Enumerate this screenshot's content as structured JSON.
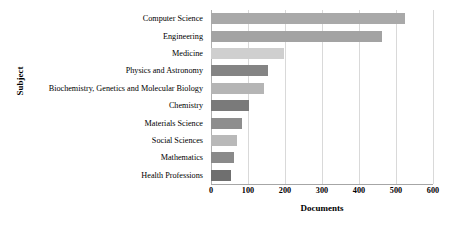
{
  "chart_data": {
    "type": "bar",
    "orientation": "horizontal",
    "title": "",
    "xlabel": "Documents",
    "ylabel": "Subject",
    "xlim": [
      0,
      600
    ],
    "xticks": [
      0,
      100,
      200,
      300,
      400,
      500,
      600
    ],
    "xtick_labels": [
      "0",
      "100",
      "200",
      "300",
      "400",
      "500",
      "600"
    ],
    "grid": true,
    "grid_axis": "x",
    "legend": null,
    "categories": [
      "Computer Science",
      "Engineering",
      "Medicine",
      "Physics and Astronomy",
      "Biochemistry, Genetics and Molecular Biology",
      "Chemistry",
      "Materials Science",
      "Social Sciences",
      "Mathematics",
      "Health Professions"
    ],
    "values": [
      524,
      462,
      196,
      155,
      143,
      102,
      84,
      70,
      62,
      55
    ],
    "bar_colors": [
      "#a9a9a9",
      "#a3a3a3",
      "#cfcfcf",
      "#848484",
      "#b5b5b5",
      "#7a7a7a",
      "#8e8e8e",
      "#b9b9b9",
      "#8a8a8a",
      "#6f6f6f"
    ]
  },
  "colors": {
    "background": "#ffffff",
    "gridline": "#d9d9d9",
    "axis": "#a6a6a6",
    "text": "#000000"
  }
}
